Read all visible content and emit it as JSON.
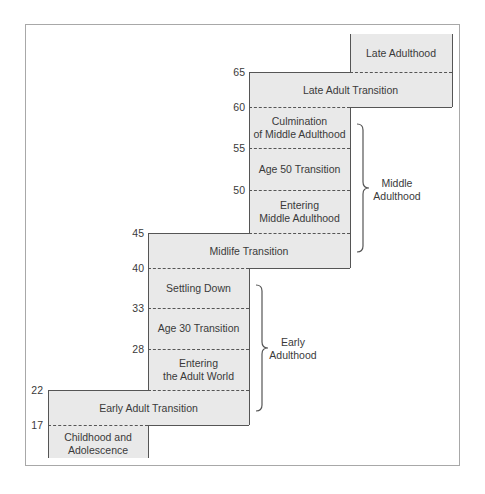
{
  "diagram": {
    "type": "staircase-life-stages",
    "ages": [
      "17",
      "22",
      "28",
      "33",
      "40",
      "45",
      "50",
      "55",
      "60",
      "65"
    ],
    "stages": [
      {
        "id": "childhood",
        "label_line1": "Childhood and",
        "label_line2": "Adolescence"
      },
      {
        "id": "early_adult_transition",
        "label": "Early Adult Transition"
      },
      {
        "id": "entering_adult_world",
        "label_line1": "Entering",
        "label_line2": "the Adult World"
      },
      {
        "id": "age30_transition",
        "label": "Age 30 Transition"
      },
      {
        "id": "settling_down",
        "label": "Settling Down"
      },
      {
        "id": "midlife_transition",
        "label": "Midlife Transition"
      },
      {
        "id": "entering_middle_adulthood",
        "label_line1": "Entering",
        "label_line2": "Middle Adulthood"
      },
      {
        "id": "age50_transition",
        "label": "Age 50 Transition"
      },
      {
        "id": "culmination_middle_adulthood",
        "label_line1": "Culmination",
        "label_line2": "of Middle Adulthood"
      },
      {
        "id": "late_adult_transition",
        "label": "Late Adult Transition"
      },
      {
        "id": "late_adulthood",
        "label": "Late Adulthood"
      }
    ],
    "eras": [
      {
        "id": "early_adulthood",
        "label_line1": "Early",
        "label_line2": "Adulthood"
      },
      {
        "id": "middle_adulthood",
        "label_line1": "Middle",
        "label_line2": "Adulthood"
      }
    ],
    "colors": {
      "block_fill": "#e9e9e9",
      "line": "#555555",
      "frame": "#a8a8a8"
    }
  }
}
